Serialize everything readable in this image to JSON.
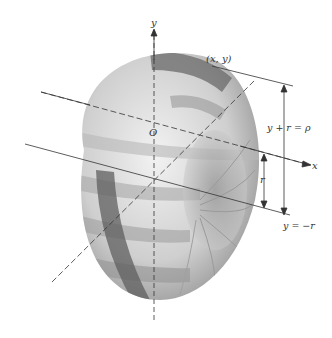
{
  "diagram": {
    "type": "3d-surface-of-revolution",
    "colors": {
      "background": "#ffffff",
      "axis": "#333333",
      "surface_light": "#e6e6e6",
      "surface_dark": "#6a6a6a"
    },
    "labels": {
      "y_axis": "y",
      "x_axis": "x",
      "origin": "O",
      "point": "(x, y)",
      "upper_dimension": "y + r = ρ",
      "radius_dimension": "r",
      "lower_line": "y = −r"
    }
  }
}
